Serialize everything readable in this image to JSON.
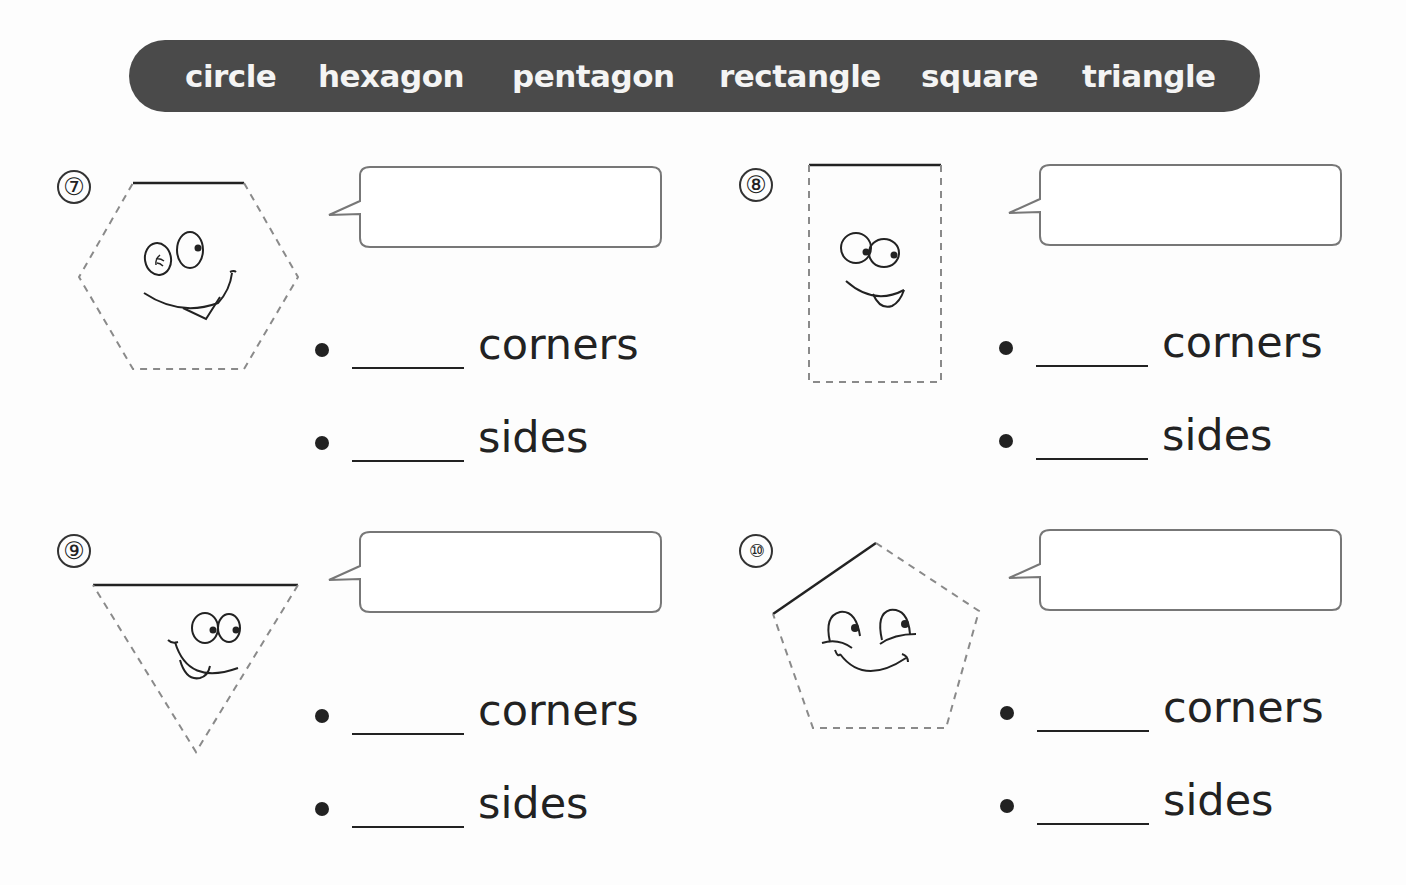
{
  "word_bank": {
    "words": [
      "circle",
      "hexagon",
      "pentagon",
      "rectangle",
      "square",
      "triangle"
    ]
  },
  "colors": {
    "word_bank_bg": "#4a4a4a",
    "word_bank_text": "#f4f4f4",
    "dashed_outline": "#8a8a8a",
    "solid_edge": "#222222",
    "bubble_border": "#777777"
  },
  "questions": [
    {
      "number": "⑦",
      "shape": "hexagon-face-icon",
      "answer_name": "",
      "rows": [
        {
          "value": "",
          "label": "corners"
        },
        {
          "value": "",
          "label": "sides"
        }
      ]
    },
    {
      "number": "⑧",
      "shape": "rectangle-face-icon",
      "answer_name": "",
      "rows": [
        {
          "value": "",
          "label": "corners"
        },
        {
          "value": "",
          "label": "sides"
        }
      ]
    },
    {
      "number": "⑨",
      "shape": "triangle-face-icon",
      "answer_name": "",
      "rows": [
        {
          "value": "",
          "label": "corners"
        },
        {
          "value": "",
          "label": "sides"
        }
      ]
    },
    {
      "number": "⑩",
      "shape": "pentagon-face-icon",
      "answer_name": "",
      "rows": [
        {
          "value": "",
          "label": "corners"
        },
        {
          "value": "",
          "label": "sides"
        }
      ]
    }
  ]
}
